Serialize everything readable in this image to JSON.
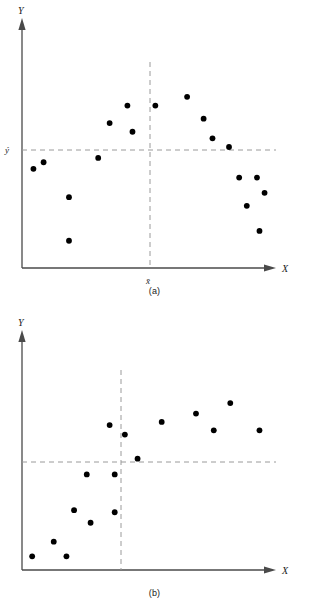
{
  "figure": {
    "background_color": "#ffffff",
    "point_color": "#000000",
    "axis_color": "#4a4a4a",
    "dash_color": "#8c8c8c"
  },
  "panels": [
    {
      "id": "a",
      "caption": "(a)",
      "x_axis_label": "X",
      "y_axis_label": "Y",
      "x_mean_label": "x̄",
      "y_mean_label": "ȳ"
    },
    {
      "id": "b",
      "caption": "(b)",
      "x_axis_label": "X",
      "y_axis_label": "Y",
      "x_mean_label": "",
      "y_mean_label": ""
    }
  ],
  "chart_data": [
    {
      "type": "scatter",
      "title": "(a)",
      "xlabel": "X",
      "ylabel": "Y",
      "xlim": [
        0,
        100
      ],
      "ylim": [
        0,
        100
      ],
      "grid": false,
      "legend": "none",
      "annotations": [
        {
          "text": "ȳ",
          "axis": "y",
          "value": 50,
          "style": "dashed-reference-line"
        },
        {
          "text": "x̄",
          "axis": "x",
          "value": 50,
          "style": "dashed-reference-line"
        }
      ],
      "x_mean": 50,
      "y_mean": 50,
      "points": [
        {
          "x": 4.5,
          "y": 45.5
        },
        {
          "x": 8.5,
          "y": 48.5
        },
        {
          "x": 18.5,
          "y": 32.5
        },
        {
          "x": 18.5,
          "y": 12.5
        },
        {
          "x": 30.0,
          "y": 50.5
        },
        {
          "x": 34.5,
          "y": 66.5
        },
        {
          "x": 41.5,
          "y": 74.5
        },
        {
          "x": 43.5,
          "y": 62.5
        },
        {
          "x": 52.5,
          "y": 74.5
        },
        {
          "x": 65.0,
          "y": 78.5
        },
        {
          "x": 71.5,
          "y": 68.5
        },
        {
          "x": 75.0,
          "y": 59.5
        },
        {
          "x": 81.5,
          "y": 55.5
        },
        {
          "x": 85.5,
          "y": 41.5
        },
        {
          "x": 88.5,
          "y": 28.5
        },
        {
          "x": 92.5,
          "y": 41.5
        },
        {
          "x": 95.5,
          "y": 34.5
        },
        {
          "x": 93.5,
          "y": 17.0
        }
      ]
    },
    {
      "type": "scatter",
      "title": "(b)",
      "xlabel": "X",
      "ylabel": "Y",
      "xlim": [
        0,
        100
      ],
      "ylim": [
        0,
        100
      ],
      "grid": false,
      "legend": "none",
      "annotations": [
        {
          "axis": "y",
          "value": 46,
          "style": "dashed-reference-line"
        },
        {
          "axis": "x",
          "value": 40,
          "style": "dashed-reference-line"
        }
      ],
      "x_mean": 40,
      "y_mean": 46,
      "points": [
        {
          "x": 4.0,
          "y": 6.5
        },
        {
          "x": 12.5,
          "y": 13.5
        },
        {
          "x": 17.5,
          "y": 6.5
        },
        {
          "x": 20.5,
          "y": 28.5
        },
        {
          "x": 25.5,
          "y": 45.5
        },
        {
          "x": 27.0,
          "y": 22.5
        },
        {
          "x": 36.5,
          "y": 45.5
        },
        {
          "x": 36.5,
          "y": 27.5
        },
        {
          "x": 34.5,
          "y": 69.0
        },
        {
          "x": 40.5,
          "y": 64.5
        },
        {
          "x": 45.5,
          "y": 53.0
        },
        {
          "x": 55.0,
          "y": 70.5
        },
        {
          "x": 68.5,
          "y": 74.5
        },
        {
          "x": 75.5,
          "y": 66.5
        },
        {
          "x": 82.0,
          "y": 79.5
        },
        {
          "x": 93.5,
          "y": 66.5
        }
      ]
    }
  ]
}
